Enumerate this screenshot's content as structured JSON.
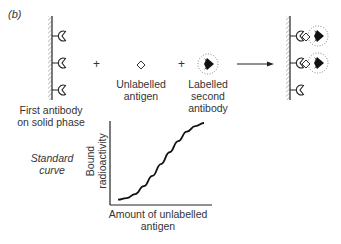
{
  "figure": {
    "panel_label": "(b)",
    "first_antibody_label_line1": "First antibody",
    "first_antibody_label_line2": "on solid phase",
    "plus_sign": "+",
    "unlabelled_antigen_line1": "Unlabelled",
    "unlabelled_antigen_line2": "antigen",
    "labelled_second_line1": "Labelled",
    "labelled_second_line2": "second",
    "labelled_second_line3": "antibody",
    "standard_curve_line1": "Standard",
    "standard_curve_line2": "curve"
  },
  "icons": {
    "solid_phase": "hatched-wall",
    "first_antibody": "pac-man-receptor",
    "antigen": "hollow-diamond",
    "labelled_antibody": "black-diamond-with-radiating-dots",
    "arrow": "right-arrow"
  },
  "chart_data": {
    "type": "line",
    "title": "Standard curve",
    "xlabel": "Amount of unlabelled antigen",
    "ylabel": "Bound radioactivity",
    "grid": false,
    "ticks": false,
    "shape": "sigmoid",
    "x": [
      0,
      0.1,
      0.2,
      0.3,
      0.4,
      0.5,
      0.6,
      0.7,
      0.8,
      0.9,
      1.0
    ],
    "values": [
      0.03,
      0.05,
      0.1,
      0.2,
      0.33,
      0.48,
      0.63,
      0.77,
      0.89,
      0.96,
      1.0
    ]
  },
  "colors": {
    "ink": "#1a1a1a",
    "hatch": "#888888",
    "background": "#ffffff"
  }
}
